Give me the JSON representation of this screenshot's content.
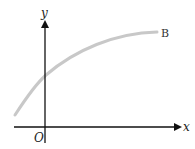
{
  "diagram": {
    "axes": {
      "x_label": "x",
      "y_label": "y",
      "origin_label": "O",
      "axis_color": "#111111"
    },
    "curve": {
      "label": "B",
      "color": "#c8c8c8",
      "description": "Increasing concave curve crossing the y-axis above the origin, levelling off toward the right"
    }
  }
}
